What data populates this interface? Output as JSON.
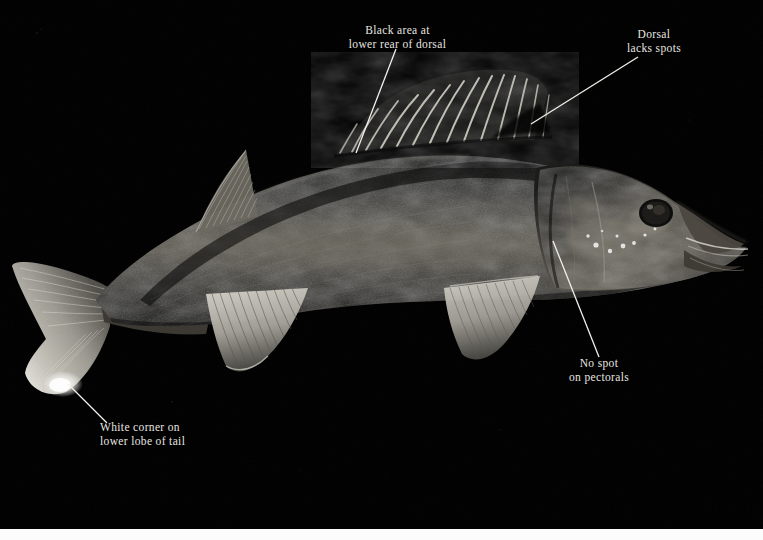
{
  "plate": {
    "subject": "walleye-specimen-photograph",
    "background_color": "#000000",
    "label_color": "#e8e6e0",
    "leader_color": "#f2f0ea",
    "bottom_strip_color": "#fcfcfc",
    "caption_alt": "Dark lateral view photograph of a walleye (Sander vitreus) on black background with four identification callouts"
  },
  "annotations": [
    {
      "id": "dorsal-black-area",
      "text": "Black area at\nlower rear of dorsal",
      "line": {
        "x1": 396,
        "y1": 49,
        "x2": 356,
        "y2": 153
      }
    },
    {
      "id": "dorsal-lacks-spots",
      "text": "Dorsal\nlacks spots",
      "line": {
        "x1": 638,
        "y1": 57,
        "x2": 531,
        "y2": 124
      }
    },
    {
      "id": "no-spot-on-pectorals",
      "text": "No spot\non pectorals",
      "line": {
        "x1": 553,
        "y1": 241,
        "x2": 599,
        "y2": 357
      }
    },
    {
      "id": "white-corner-lower-tail",
      "text": "White corner on\nlower lobe of tail",
      "line": {
        "x1": 68,
        "y1": 384,
        "x2": 107,
        "y2": 423
      }
    }
  ]
}
